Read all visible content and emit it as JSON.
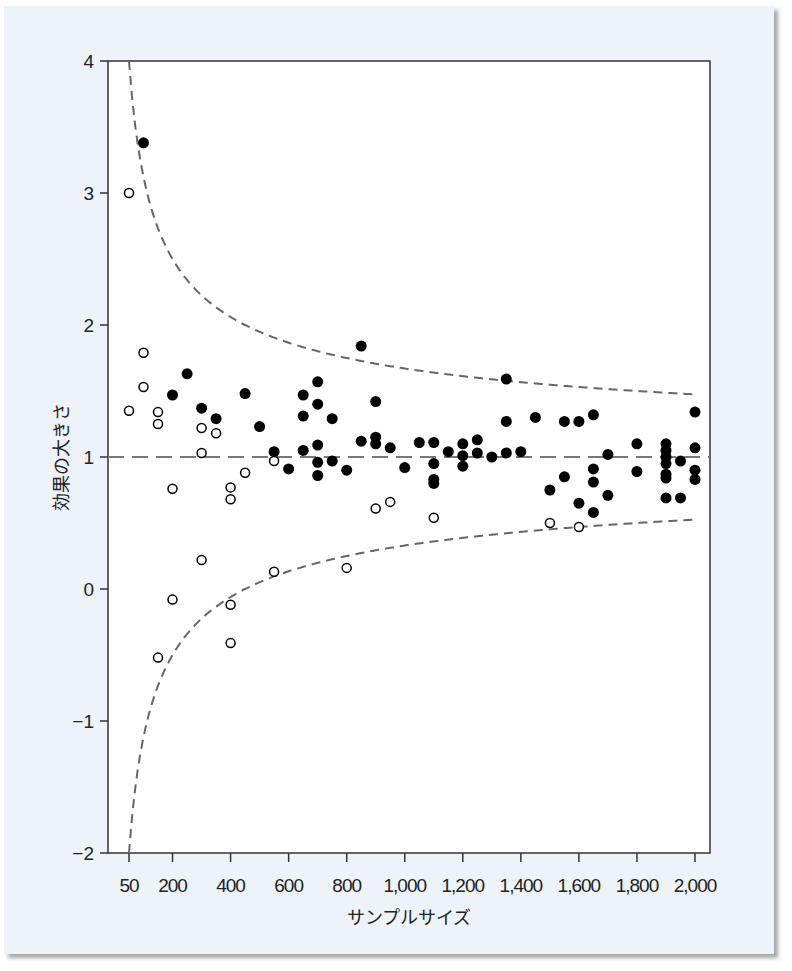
{
  "chart_data": {
    "type": "scatter",
    "title": "",
    "xlabel": "サンプルサイズ",
    "ylabel": "効果の大きさ",
    "xlim": [
      50,
      2000
    ],
    "ylim": [
      -2,
      4
    ],
    "x_ticks": [
      50,
      200,
      400,
      600,
      800,
      1000,
      1200,
      1400,
      1600,
      1800,
      2000
    ],
    "x_tick_labels": [
      "50",
      "200",
      "400",
      "600",
      "800",
      "1,000",
      "1,200",
      "1,400",
      "1,600",
      "1,800",
      "2,000"
    ],
    "y_ticks": [
      -2,
      -1,
      0,
      1,
      2,
      3,
      4
    ],
    "y_tick_labels": [
      "−2",
      "−1",
      "0",
      "1",
      "2",
      "3",
      "4"
    ],
    "grid": false,
    "legend": null,
    "reference_line": {
      "y": 1,
      "style": "long-dash",
      "color": "#777777"
    },
    "funnel_bounds": {
      "style": "dashed",
      "color": "#666666",
      "center": 1,
      "description": "upper and lower funnel boundaries narrowing toward effect size 1 as sample size increases"
    },
    "series": [
      {
        "name": "filled",
        "marker": "filled-circle",
        "color": "#000000",
        "points": [
          [
            100,
            3.38
          ],
          [
            200,
            1.47
          ],
          [
            250,
            1.63
          ],
          [
            300,
            1.37
          ],
          [
            350,
            1.29
          ],
          [
            450,
            1.48
          ],
          [
            500,
            1.23
          ],
          [
            550,
            1.04
          ],
          [
            600,
            0.91
          ],
          [
            650,
            1.47
          ],
          [
            650,
            1.31
          ],
          [
            650,
            1.05
          ],
          [
            700,
            1.57
          ],
          [
            700,
            1.4
          ],
          [
            700,
            1.09
          ],
          [
            700,
            0.96
          ],
          [
            700,
            0.86
          ],
          [
            750,
            1.29
          ],
          [
            750,
            0.97
          ],
          [
            800,
            0.9
          ],
          [
            850,
            1.84
          ],
          [
            850,
            1.12
          ],
          [
            900,
            1.42
          ],
          [
            900,
            1.15
          ],
          [
            900,
            1.1
          ],
          [
            950,
            1.07
          ],
          [
            1000,
            0.92
          ],
          [
            1050,
            1.11
          ],
          [
            1100,
            1.11
          ],
          [
            1100,
            0.95
          ],
          [
            1100,
            0.83
          ],
          [
            1100,
            0.8
          ],
          [
            1150,
            1.04
          ],
          [
            1200,
            1.1
          ],
          [
            1200,
            1.01
          ],
          [
            1200,
            0.93
          ],
          [
            1250,
            1.13
          ],
          [
            1250,
            1.03
          ],
          [
            1300,
            1.0
          ],
          [
            1350,
            1.59
          ],
          [
            1350,
            1.27
          ],
          [
            1350,
            1.03
          ],
          [
            1400,
            1.04
          ],
          [
            1450,
            1.3
          ],
          [
            1500,
            0.75
          ],
          [
            1550,
            1.27
          ],
          [
            1550,
            0.85
          ],
          [
            1600,
            1.27
          ],
          [
            1600,
            0.65
          ],
          [
            1650,
            1.32
          ],
          [
            1650,
            0.91
          ],
          [
            1650,
            0.81
          ],
          [
            1650,
            0.58
          ],
          [
            1700,
            1.02
          ],
          [
            1700,
            0.71
          ],
          [
            1800,
            1.1
          ],
          [
            1800,
            0.89
          ],
          [
            1900,
            1.1
          ],
          [
            1900,
            1.05
          ],
          [
            1900,
            1.0
          ],
          [
            1900,
            0.95
          ],
          [
            1900,
            0.87
          ],
          [
            1900,
            0.84
          ],
          [
            1900,
            0.69
          ],
          [
            1950,
            0.97
          ],
          [
            1950,
            0.69
          ],
          [
            2000,
            1.34
          ],
          [
            2000,
            1.07
          ],
          [
            2000,
            0.9
          ],
          [
            2000,
            0.83
          ]
        ]
      },
      {
        "name": "open",
        "marker": "open-circle",
        "color": "#000000",
        "points": [
          [
            50,
            3.0
          ],
          [
            50,
            1.35
          ],
          [
            100,
            1.79
          ],
          [
            100,
            1.53
          ],
          [
            150,
            1.34
          ],
          [
            150,
            1.25
          ],
          [
            150,
            -0.52
          ],
          [
            200,
            0.76
          ],
          [
            200,
            -0.08
          ],
          [
            300,
            1.22
          ],
          [
            300,
            1.03
          ],
          [
            300,
            0.22
          ],
          [
            350,
            1.18
          ],
          [
            400,
            0.77
          ],
          [
            400,
            0.68
          ],
          [
            400,
            -0.12
          ],
          [
            400,
            -0.41
          ],
          [
            450,
            0.88
          ],
          [
            550,
            0.97
          ],
          [
            550,
            0.13
          ],
          [
            800,
            0.16
          ],
          [
            900,
            0.61
          ],
          [
            950,
            0.66
          ],
          [
            1100,
            0.54
          ],
          [
            1500,
            0.5
          ],
          [
            1600,
            0.47
          ]
        ]
      }
    ]
  }
}
